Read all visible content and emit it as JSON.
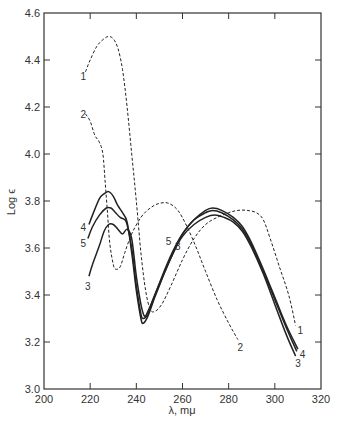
{
  "chart_data": {
    "type": "line",
    "title": "",
    "xlabel": "λ, mμ",
    "ylabel": "Log ϵ",
    "xlim": [
      200,
      320
    ],
    "ylim": [
      3.0,
      4.6
    ],
    "xticks": [
      200,
      220,
      240,
      260,
      280,
      300,
      320
    ],
    "yticks": [
      3.0,
      3.2,
      3.4,
      3.6,
      3.8,
      4.0,
      4.2,
      4.4,
      4.6
    ],
    "xtick_labels": [
      "200",
      "220",
      "240",
      "260",
      "280",
      "300",
      "320"
    ],
    "ytick_labels": [
      "3.0",
      "3.2",
      "3.4",
      "3.6",
      "3.8",
      "4.0",
      "4.2",
      "4.4",
      "4.6"
    ],
    "grid": false,
    "legend": "none (curves labeled inline with numbers)",
    "series": [
      {
        "name": "1",
        "style": "dashed",
        "points": [
          [
            218,
            4.35
          ],
          [
            220,
            4.4
          ],
          [
            223,
            4.46
          ],
          [
            226,
            4.49
          ],
          [
            228,
            4.5
          ],
          [
            230,
            4.49
          ],
          [
            232,
            4.45
          ],
          [
            234,
            4.36
          ],
          [
            236,
            4.2
          ],
          [
            238,
            4.0
          ],
          [
            240,
            3.8
          ],
          [
            242,
            3.58
          ],
          [
            244,
            3.42
          ],
          [
            246,
            3.34
          ],
          [
            248,
            3.33
          ],
          [
            251,
            3.36
          ],
          [
            255,
            3.44
          ],
          [
            260,
            3.55
          ],
          [
            265,
            3.64
          ],
          [
            270,
            3.7
          ],
          [
            275,
            3.73
          ],
          [
            280,
            3.75
          ],
          [
            284,
            3.76
          ],
          [
            288,
            3.76
          ],
          [
            292,
            3.75
          ],
          [
            295,
            3.72
          ],
          [
            298,
            3.64
          ],
          [
            302,
            3.52
          ],
          [
            306,
            3.4
          ],
          [
            309,
            3.27
          ]
        ],
        "label_pos": [
          217,
          4.33
        ],
        "label_end_pos": [
          311,
          3.25
        ]
      },
      {
        "name": "2",
        "style": "dashed",
        "points": [
          [
            218,
            4.17
          ],
          [
            220,
            4.14
          ],
          [
            222,
            4.08
          ],
          [
            224,
            4.05
          ],
          [
            225.5,
            4.0
          ],
          [
            226.5,
            3.88
          ],
          [
            227.5,
            3.75
          ],
          [
            228.5,
            3.62
          ],
          [
            230,
            3.53
          ],
          [
            231,
            3.51
          ],
          [
            233,
            3.52
          ],
          [
            235,
            3.58
          ],
          [
            238,
            3.66
          ],
          [
            242,
            3.73
          ],
          [
            246,
            3.77
          ],
          [
            250,
            3.79
          ],
          [
            254,
            3.79
          ],
          [
            258,
            3.76
          ],
          [
            262,
            3.69
          ],
          [
            266,
            3.6
          ],
          [
            270,
            3.5
          ],
          [
            275,
            3.38
          ],
          [
            280,
            3.28
          ],
          [
            284,
            3.21
          ]
        ],
        "label_pos": [
          217,
          4.17
        ],
        "label_end_pos": [
          285,
          3.18
        ]
      },
      {
        "name": "3",
        "style": "solid",
        "points": [
          [
            219.5,
            3.48
          ],
          [
            221,
            3.53
          ],
          [
            224,
            3.61
          ],
          [
            226,
            3.67
          ],
          [
            228,
            3.7
          ],
          [
            230,
            3.7
          ],
          [
            232,
            3.68
          ],
          [
            234,
            3.66
          ],
          [
            236,
            3.68
          ],
          [
            238,
            3.64
          ],
          [
            240,
            3.48
          ],
          [
            242,
            3.36
          ],
          [
            243.5,
            3.31
          ],
          [
            245,
            3.33
          ],
          [
            248,
            3.4
          ],
          [
            252,
            3.49
          ],
          [
            256,
            3.58
          ],
          [
            260,
            3.65
          ],
          [
            265,
            3.7
          ],
          [
            270,
            3.73
          ],
          [
            274,
            3.74
          ],
          [
            278,
            3.73
          ],
          [
            282,
            3.71
          ],
          [
            286,
            3.67
          ],
          [
            290,
            3.6
          ],
          [
            295,
            3.49
          ],
          [
            300,
            3.36
          ],
          [
            305,
            3.23
          ],
          [
            309,
            3.14
          ]
        ],
        "label_pos": [
          219,
          3.44
        ],
        "label_end_pos": [
          310,
          3.11
        ],
        "label_mid_pos": [
          258,
          3.61
        ]
      },
      {
        "name": "4",
        "style": "solid",
        "points": [
          [
            219.5,
            3.7
          ],
          [
            221,
            3.74
          ],
          [
            224,
            3.81
          ],
          [
            226,
            3.83
          ],
          [
            228,
            3.84
          ],
          [
            230,
            3.82
          ],
          [
            232,
            3.78
          ],
          [
            234,
            3.75
          ],
          [
            236,
            3.71
          ],
          [
            238,
            3.58
          ],
          [
            240,
            3.42
          ],
          [
            242,
            3.3
          ],
          [
            243,
            3.28
          ],
          [
            245,
            3.31
          ],
          [
            248,
            3.39
          ],
          [
            252,
            3.49
          ],
          [
            256,
            3.58
          ],
          [
            260,
            3.66
          ],
          [
            265,
            3.72
          ],
          [
            270,
            3.76
          ],
          [
            273,
            3.77
          ],
          [
            277,
            3.76
          ],
          [
            282,
            3.73
          ],
          [
            286,
            3.69
          ],
          [
            290,
            3.62
          ],
          [
            295,
            3.51
          ],
          [
            300,
            3.39
          ],
          [
            305,
            3.27
          ],
          [
            310,
            3.17
          ]
        ],
        "label_pos": [
          217,
          3.69
        ],
        "label_end_pos": [
          312,
          3.15
        ]
      },
      {
        "name": "5",
        "style": "solid",
        "points": [
          [
            219,
            3.64
          ],
          [
            221,
            3.69
          ],
          [
            224,
            3.74
          ],
          [
            227,
            3.77
          ],
          [
            229,
            3.77
          ],
          [
            231,
            3.75
          ],
          [
            233,
            3.73
          ],
          [
            235,
            3.72
          ],
          [
            236,
            3.7
          ],
          [
            238,
            3.6
          ],
          [
            240,
            3.44
          ],
          [
            242,
            3.32
          ],
          [
            243,
            3.3
          ],
          [
            245,
            3.32
          ],
          [
            248,
            3.4
          ],
          [
            252,
            3.5
          ],
          [
            256,
            3.59
          ],
          [
            260,
            3.66
          ],
          [
            265,
            3.72
          ],
          [
            270,
            3.75
          ],
          [
            273,
            3.76
          ],
          [
            277,
            3.75
          ],
          [
            282,
            3.72
          ],
          [
            286,
            3.68
          ],
          [
            290,
            3.61
          ],
          [
            295,
            3.5
          ],
          [
            300,
            3.38
          ],
          [
            305,
            3.26
          ],
          [
            309.5,
            3.16
          ]
        ],
        "label_pos": [
          217,
          3.62
        ],
        "label_mid_pos": [
          254,
          3.63
        ]
      }
    ]
  },
  "axes": {
    "xlabel": "λ, mμ",
    "ylabel": "Log ϵ"
  }
}
